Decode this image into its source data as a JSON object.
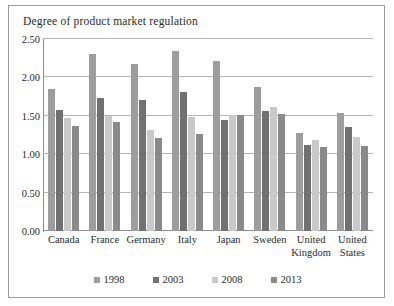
{
  "chart_data": {
    "type": "bar",
    "title": "Degree of product market regulation",
    "xlabel": "",
    "ylabel": "",
    "ylim": [
      0.0,
      2.5
    ],
    "ytick_labels": [
      "2.50",
      "2.00",
      "1.50",
      "1.00",
      "0.50",
      "0.00"
    ],
    "ytick_values": [
      2.5,
      2.0,
      1.5,
      1.0,
      0.5,
      0.0
    ],
    "grid": true,
    "legend_position": "bottom",
    "categories": [
      "Canada",
      "France",
      "Germany",
      "Italy",
      "Japan",
      "Sweden",
      "United Kingdom",
      "United States"
    ],
    "category_lines": [
      [
        "Canada"
      ],
      [
        "France"
      ],
      [
        "Germany"
      ],
      [
        "Italy"
      ],
      [
        "Japan"
      ],
      [
        "Sweden"
      ],
      [
        "United",
        "Kingdom"
      ],
      [
        "United",
        "States"
      ]
    ],
    "series": [
      {
        "name": "1998",
        "color": "#9d9d9d",
        "values": [
          1.85,
          2.31,
          2.17,
          2.35,
          2.21,
          1.87,
          1.27,
          1.54
        ]
      },
      {
        "name": "2003",
        "color": "#717171",
        "values": [
          1.57,
          1.73,
          1.71,
          1.81,
          1.45,
          1.56,
          1.12,
          1.36
        ]
      },
      {
        "name": "2008",
        "color": "#c9c9c9",
        "values": [
          1.47,
          1.5,
          1.31,
          1.48,
          1.51,
          1.62,
          1.18,
          1.22
        ]
      },
      {
        "name": "2013",
        "color": "#8a8a8a",
        "values": [
          1.37,
          1.42,
          1.21,
          1.26,
          1.51,
          1.52,
          1.1,
          1.11
        ]
      }
    ]
  },
  "legend": {
    "items": [
      {
        "label": "1998",
        "color": "#9d9d9d"
      },
      {
        "label": "2003",
        "color": "#717171"
      },
      {
        "label": "2008",
        "color": "#c9c9c9"
      },
      {
        "label": "2013",
        "color": "#8a8a8a"
      }
    ]
  }
}
